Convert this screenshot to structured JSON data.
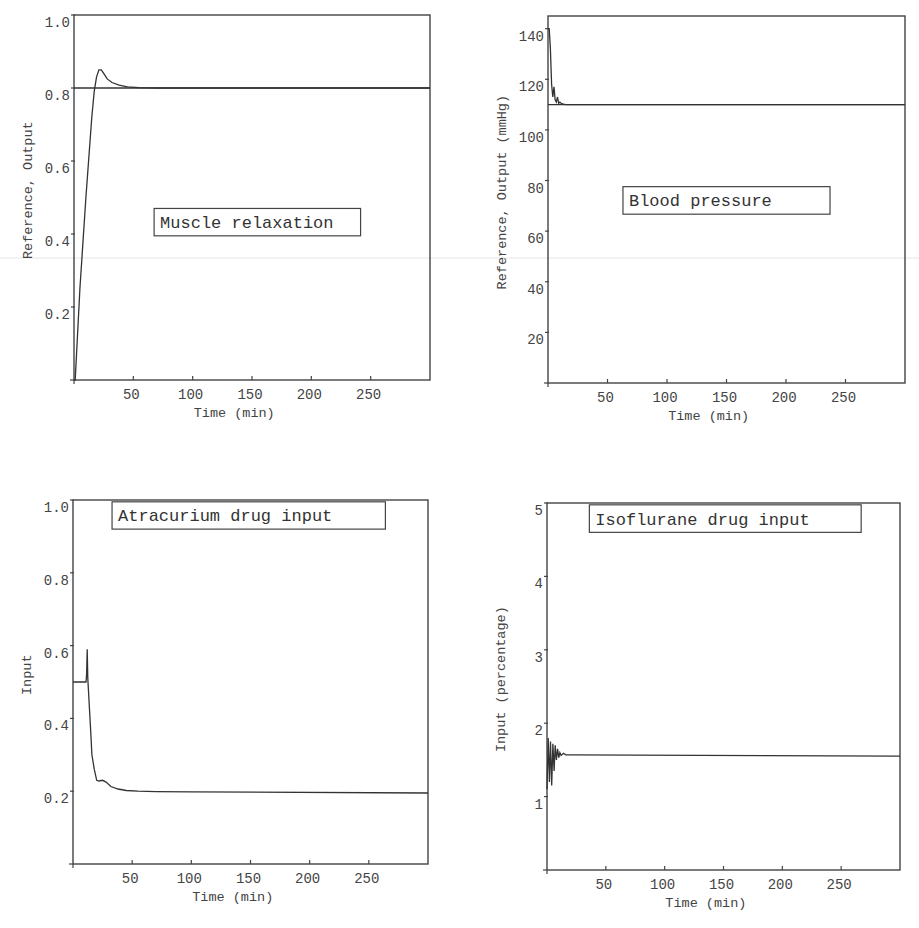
{
  "chart_data": [
    {
      "id": "muscle",
      "type": "line",
      "title": "Muscle relaxation",
      "xlabel": "Time (min)",
      "ylabel": "Reference, Output",
      "xlim": [
        0,
        300
      ],
      "ylim": [
        0,
        1.0
      ],
      "xticks": [
        50,
        100,
        150,
        200,
        250
      ],
      "yticks": [
        0.2,
        0.4,
        0.6,
        0.8,
        1.0
      ],
      "ytick_labels": [
        "0.2",
        "0.4",
        "0.6",
        "0.8",
        "1.0"
      ],
      "grid": false,
      "label_box": {
        "x": 0.225,
        "y": 0.53,
        "w": 0.58,
        "h": 0.075
      },
      "series": [
        {
          "name": "Reference",
          "x": [
            0,
            300
          ],
          "y": [
            0.8,
            0.8
          ]
        },
        {
          "name": "Output",
          "x": [
            0,
            1,
            5,
            10,
            15,
            17,
            19,
            21,
            23,
            25,
            28,
            32,
            38,
            45,
            55,
            70,
            100,
            300
          ],
          "y": [
            0.0,
            0.0,
            0.25,
            0.5,
            0.72,
            0.79,
            0.83,
            0.85,
            0.85,
            0.84,
            0.825,
            0.815,
            0.808,
            0.803,
            0.801,
            0.8,
            0.8,
            0.8
          ]
        }
      ]
    },
    {
      "id": "bp",
      "type": "line",
      "title": "Blood pressure",
      "xlabel": "Time (min)",
      "ylabel": "Reference, Output  (mmHg)",
      "xlim": [
        0,
        300
      ],
      "ylim": [
        0,
        145
      ],
      "xticks": [
        50,
        100,
        150,
        200,
        250
      ],
      "yticks": [
        20,
        40,
        60,
        80,
        100,
        120,
        140
      ],
      "ytick_labels": [
        "20",
        "40",
        "60",
        "80",
        "100",
        "120",
        "140"
      ],
      "grid": false,
      "label_box": {
        "x": 0.21,
        "y": 0.465,
        "w": 0.58,
        "h": 0.075
      },
      "series": [
        {
          "name": "Reference",
          "x": [
            0,
            300
          ],
          "y": [
            110,
            110
          ]
        },
        {
          "name": "Output",
          "x": [
            0,
            1,
            2,
            3,
            4,
            5,
            6,
            7,
            8,
            9,
            10,
            11,
            13,
            15,
            300
          ],
          "y": [
            140,
            140,
            132,
            118,
            113,
            117,
            112,
            111,
            113,
            110.5,
            111,
            110.5,
            110.2,
            110,
            110
          ]
        }
      ]
    },
    {
      "id": "atracurium",
      "type": "line",
      "title": "Atracurium drug input",
      "xlabel": "Time (min)",
      "ylabel": "Input",
      "xlim": [
        0,
        300
      ],
      "ylim": [
        0,
        1.0
      ],
      "xticks": [
        50,
        100,
        150,
        200,
        250
      ],
      "yticks": [
        0.2,
        0.4,
        0.6,
        0.8,
        1.0
      ],
      "ytick_labels": [
        "0.2",
        "0.4",
        "0.6",
        "0.8",
        "1.0"
      ],
      "grid": false,
      "label_box": {
        "x": 0.11,
        "y": 0.005,
        "w": 0.77,
        "h": 0.075
      },
      "series": [
        {
          "name": "Input",
          "x": [
            0,
            11,
            11.5,
            12,
            12.5,
            13,
            14,
            15,
            16,
            18,
            20,
            22,
            25,
            28,
            32,
            38,
            45,
            55,
            70,
            100,
            300
          ],
          "y": [
            0.5,
            0.5,
            0.52,
            0.59,
            0.51,
            0.48,
            0.42,
            0.36,
            0.3,
            0.26,
            0.23,
            0.228,
            0.23,
            0.225,
            0.213,
            0.206,
            0.202,
            0.2,
            0.199,
            0.198,
            0.195
          ]
        }
      ]
    },
    {
      "id": "isoflurane",
      "type": "line",
      "title": "Isoflurane drug input",
      "xlabel": "Time (min)",
      "ylabel": "Input (percentage)",
      "xlim": [
        0,
        300
      ],
      "ylim": [
        0,
        5
      ],
      "xticks": [
        50,
        100,
        150,
        200,
        250
      ],
      "yticks": [
        1,
        2,
        3,
        4,
        5
      ],
      "ytick_labels": [
        "1",
        "2",
        "3",
        "4",
        "5"
      ],
      "grid": false,
      "label_box": {
        "x": 0.12,
        "y": 0.005,
        "w": 0.77,
        "h": 0.075
      },
      "series": [
        {
          "name": "Input",
          "x": [
            0,
            1,
            2,
            3,
            4,
            5,
            6,
            7,
            8,
            9,
            10,
            11,
            12,
            14,
            16,
            20,
            300
          ],
          "y": [
            1.1,
            1.8,
            1.2,
            1.75,
            1.15,
            1.72,
            1.35,
            1.7,
            1.5,
            1.65,
            1.53,
            1.6,
            1.56,
            1.59,
            1.57,
            1.57,
            1.55
          ]
        }
      ]
    }
  ],
  "panels": [
    {
      "left": 74,
      "top": 15,
      "width": 356,
      "height": 365
    },
    {
      "left": 548,
      "top": 16,
      "width": 357,
      "height": 367
    },
    {
      "left": 73,
      "top": 500,
      "width": 355,
      "height": 364
    },
    {
      "left": 547,
      "top": 503,
      "width": 353,
      "height": 367
    }
  ]
}
